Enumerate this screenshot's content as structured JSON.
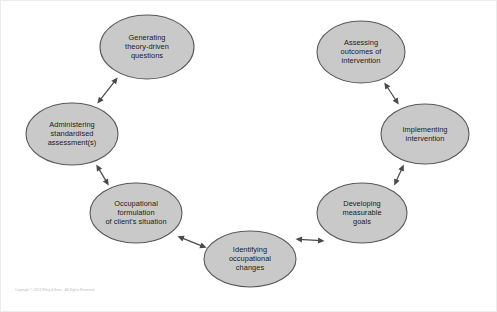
{
  "figure": {
    "background_color": "#ffffff",
    "node_fill_color": "#c9c9c9",
    "node_stroke_color": "#595959",
    "arrow_color": "#4a4a4a",
    "text_color": "#1a1a1a",
    "copyright": "Copyright © 2013 Wiley & Sons - All Rights Reserved"
  },
  "diagram_data": {
    "type": "cycle-diagram",
    "layout": "horseshoe",
    "arrow_style": "double-headed",
    "node_count": 7,
    "nodes": [
      {
        "id": "generating-questions",
        "lines": [
          "Generating",
          "theory-driven",
          "questions"
        ],
        "cx": 146,
        "cy": 46,
        "rx": 47,
        "ry": 32
      },
      {
        "id": "administering-assessments",
        "lines": [
          "Administering",
          "standardised",
          "assessment(s)"
        ],
        "cx": 71,
        "cy": 133,
        "rx": 46,
        "ry": 31
      },
      {
        "id": "occupational-formulation",
        "lines": [
          "Occupational",
          "formulation",
          "of client's situation"
        ],
        "cx": 135,
        "cy": 212,
        "rx": 46,
        "ry": 30
      },
      {
        "id": "identifying-changes",
        "lines": [
          "Identifying",
          "occupational",
          "changes"
        ],
        "cx": 249,
        "cy": 258,
        "rx": 46,
        "ry": 28
      },
      {
        "id": "developing-goals",
        "lines": [
          "Developing",
          "measurable",
          "goals"
        ],
        "cx": 361,
        "cy": 212,
        "rx": 45,
        "ry": 30
      },
      {
        "id": "implementing-intervention",
        "lines": [
          "Implementing",
          "intervention"
        ],
        "cx": 424,
        "cy": 133,
        "rx": 44,
        "ry": 30
      },
      {
        "id": "assessing-outcomes",
        "lines": [
          "Assessing",
          "outcomes of",
          "intervention"
        ],
        "cx": 360,
        "cy": 51,
        "rx": 44,
        "ry": 31
      }
    ],
    "edges": [
      {
        "id": "edge-assessments-questions",
        "from": "administering-assessments",
        "to": "generating-questions",
        "x1": 96,
        "y1": 103,
        "x2": 117,
        "y2": 76
      },
      {
        "id": "edge-formulation-assessments",
        "from": "occupational-formulation",
        "to": "administering-assessments",
        "x1": 108,
        "y1": 185,
        "x2": 95,
        "y2": 163
      },
      {
        "id": "edge-identifying-formulation",
        "from": "identifying-changes",
        "to": "occupational-formulation",
        "x1": 206,
        "y1": 247,
        "x2": 176,
        "y2": 235
      },
      {
        "id": "edge-goals-identifying",
        "from": "developing-goals",
        "to": "identifying-changes",
        "x1": 294,
        "y1": 238,
        "x2": 324,
        "y2": 240
      },
      {
        "id": "edge-implementing-goals",
        "from": "implementing-intervention",
        "to": "developing-goals",
        "x1": 393,
        "y1": 185,
        "x2": 403,
        "y2": 163
      },
      {
        "id": "edge-outcomes-implementing",
        "from": "assessing-outcomes",
        "to": "implementing-intervention",
        "x1": 398,
        "y1": 104,
        "x2": 383,
        "y2": 81
      }
    ]
  }
}
